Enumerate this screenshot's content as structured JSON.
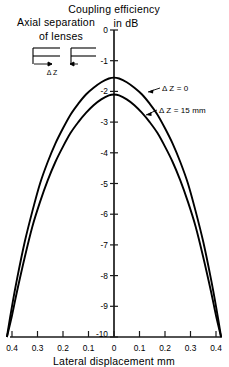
{
  "chart_data": {
    "type": "line",
    "title": "Coupling efficiency in dB",
    "title_line1": "Coupling efficiency",
    "title_line2": "in dB",
    "xlabel": "Lateral displacement mm",
    "ylabel": "Coupling efficiency in dB",
    "xlim": [
      -0.45,
      0.45
    ],
    "ylim": [
      -10,
      0
    ],
    "grid": false,
    "legend": "annotations-on-curves",
    "x_ticks": [
      -0.4,
      -0.3,
      -0.2,
      -0.1,
      0,
      0.1,
      0.2,
      0.3,
      0.4
    ],
    "x_tick_labels": [
      "0.4",
      "0.3",
      "0.2",
      "0.1",
      "0",
      "0.1",
      "0.2",
      "0.3",
      "0.4"
    ],
    "y_ticks": [
      0,
      -1,
      -2,
      -3,
      -4,
      -5,
      -6,
      -7,
      -8,
      -9,
      -10
    ],
    "y_tick_labels": [
      "0",
      "-1",
      "-2",
      "-3",
      "-4",
      "-5",
      "-6",
      "-7",
      "-8",
      "-9",
      "-10"
    ],
    "x": [
      -0.42,
      -0.4,
      -0.38,
      -0.35,
      -0.32,
      -0.29,
      -0.26,
      -0.23,
      -0.2,
      -0.17,
      -0.14,
      -0.11,
      -0.08,
      -0.05,
      -0.02,
      0.0,
      0.02,
      0.05,
      0.08,
      0.11,
      0.14,
      0.17,
      0.2,
      0.23,
      0.26,
      0.29,
      0.32,
      0.35,
      0.38,
      0.4,
      0.42
    ],
    "series": [
      {
        "name": "ΔZ = 0",
        "label": "Δ Z = 0",
        "peak": -1.55,
        "values": [
          -10.0,
          -9.0,
          -8.1,
          -6.9,
          -5.9,
          -5.0,
          -4.3,
          -3.7,
          -3.2,
          -2.75,
          -2.4,
          -2.1,
          -1.88,
          -1.7,
          -1.58,
          -1.55,
          -1.58,
          -1.7,
          -1.88,
          -2.1,
          -2.4,
          -2.75,
          -3.2,
          -3.7,
          -4.3,
          -5.0,
          -5.9,
          -6.9,
          -8.1,
          -9.0,
          -10.0
        ]
      },
      {
        "name": "ΔZ = 15 mm",
        "label": "Δ Z = 15 mm",
        "peak": -2.1,
        "values": [
          -10.0,
          -9.3,
          -8.5,
          -7.4,
          -6.4,
          -5.6,
          -4.9,
          -4.3,
          -3.8,
          -3.35,
          -3.0,
          -2.7,
          -2.45,
          -2.26,
          -2.13,
          -2.1,
          -2.13,
          -2.26,
          -2.45,
          -2.7,
          -3.0,
          -3.35,
          -3.8,
          -4.3,
          -4.9,
          -5.6,
          -6.4,
          -7.4,
          -8.5,
          -9.3,
          -10.0
        ]
      }
    ],
    "annotations": [
      {
        "text": "Δ Z = 0",
        "target_x": 0.19,
        "target_y": -2.25
      },
      {
        "text": "Δ Z = 15 mm",
        "target_x": 0.235,
        "target_y": -3.1
      }
    ]
  },
  "inset": {
    "line1": "Axial  separation",
    "line2": "of lenses",
    "gap_label": "Δ Z",
    "name": "axial-separation-of-lenses-diagram"
  },
  "colors": {
    "ink": "#000000",
    "background": "#ffffff",
    "axis": "#1a1a1a"
  }
}
